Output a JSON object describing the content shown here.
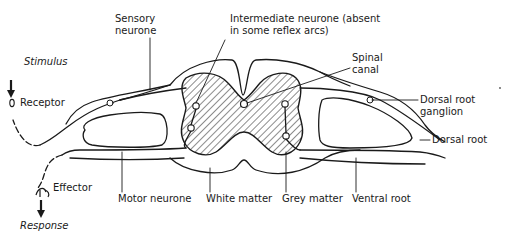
{
  "diagram": {
    "colors": {
      "ink": "#1a1a1a",
      "background": "#ffffff"
    },
    "labels": {
      "sensory_neurone_1": "Sensory",
      "sensory_neurone_2": "neurone",
      "intermediate_1": "Intermediate neurone (absent",
      "intermediate_2": "in some reflex arcs)",
      "spinal_canal_1": "Spinal",
      "spinal_canal_2": "canal",
      "stimulus": "Stimulus",
      "receptor": "Receptor",
      "dorsal_root_ganglion_1": "Dorsal root",
      "dorsal_root_ganglion_2": "ganglion",
      "dorsal_root": "Dorsal root",
      "effector": "Effector",
      "motor_neurone": "Motor neurone",
      "white_matter": "White matter",
      "grey_matter": "Grey matter",
      "ventral_root": "Ventral root",
      "response": "Response"
    },
    "icons": {
      "stimulus_arrow": "arrow-down-icon",
      "response_arrow": "arrow-down-icon",
      "receptor": "receptor-oval-icon",
      "effector": "effector-muscle-icon"
    }
  }
}
